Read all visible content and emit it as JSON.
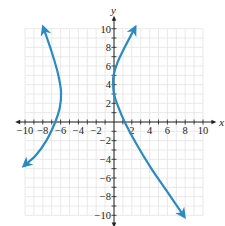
{
  "chart_data": {
    "type": "line",
    "title": "",
    "xlabel": "x",
    "ylabel": "y",
    "xlim": [
      -10,
      10
    ],
    "ylim": [
      -10,
      10
    ],
    "grid": true,
    "grid_minor_step": 1,
    "x_ticks": [
      -10,
      -8,
      -6,
      -4,
      -2,
      2,
      4,
      6,
      8,
      10
    ],
    "y_ticks": [
      -10,
      -8,
      -6,
      -4,
      -2,
      2,
      4,
      6,
      8,
      10
    ],
    "x_tick_labels": [
      "−10",
      "−8",
      "−6",
      "−4",
      "−2",
      "2",
      "4",
      "6",
      "8",
      "10"
    ],
    "y_tick_labels": [
      "−10",
      "−8",
      "−6",
      "−4",
      "−2",
      "2",
      "4",
      "6",
      "8",
      "10"
    ],
    "series": [
      {
        "name": "left-branch",
        "color": "#2a8ac4",
        "arrows": "both",
        "points": [
          [
            -7.9,
            10
          ],
          [
            -7.0,
            7.5
          ],
          [
            -6.3,
            5.2
          ],
          [
            -5.95,
            3.2
          ],
          [
            -6.1,
            1.5
          ],
          [
            -6.6,
            0.0
          ],
          [
            -7.6,
            -2.0
          ],
          [
            -8.8,
            -3.6
          ],
          [
            -10.0,
            -4.6
          ]
        ]
      },
      {
        "name": "right-branch",
        "color": "#2a8ac4",
        "arrows": "both",
        "points": [
          [
            2.3,
            10
          ],
          [
            1.2,
            8.0
          ],
          [
            0.4,
            6.4
          ],
          [
            -0.05,
            5.0
          ],
          [
            -0.1,
            4.0
          ],
          [
            0.0,
            3.0
          ],
          [
            0.4,
            1.8
          ],
          [
            1.2,
            0.0
          ],
          [
            2.6,
            -2.5
          ],
          [
            4.2,
            -5.0
          ],
          [
            6.0,
            -7.5
          ],
          [
            7.8,
            -10.0
          ]
        ]
      }
    ]
  },
  "axes": {
    "x_label": "x",
    "y_label": "y"
  }
}
